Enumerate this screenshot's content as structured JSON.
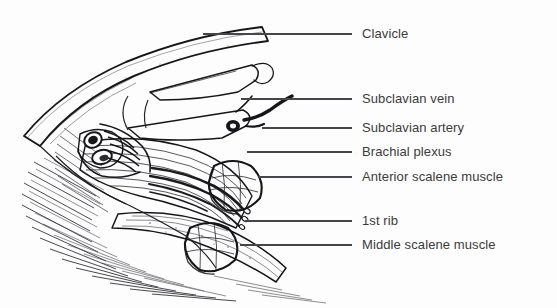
{
  "figure": {
    "kind": "anatomical-line-drawing",
    "view": "oblique anterior",
    "background_color": "#fdfdfd",
    "ink_color": "#16161a",
    "label_color": "#3b3b3b",
    "leader_color": "#45454a"
  },
  "labels": [
    {
      "id": "clavicle",
      "text": "Clavicle",
      "text_x": 362,
      "text_y": 35,
      "leader_x1": 203,
      "leader_x2": 352,
      "leader_y": 34
    },
    {
      "id": "subclavian-vein",
      "text": "Subclavian vein",
      "text_x": 362,
      "text_y": 100,
      "leader_x1": 241,
      "leader_x2": 352,
      "leader_y": 99
    },
    {
      "id": "subclavian-artery",
      "text": "Subclavian artery",
      "text_x": 362,
      "text_y": 129,
      "leader_x1": 262,
      "leader_x2": 352,
      "leader_y": 128
    },
    {
      "id": "brachial-plexus",
      "text": "Brachial plexus",
      "text_x": 362,
      "text_y": 153,
      "leader_x1": 247,
      "leader_x2": 352,
      "leader_y": 152
    },
    {
      "id": "anterior-scalene-muscle",
      "text": "Anterior scalene muscle",
      "text_x": 362,
      "text_y": 178,
      "leader_x1": 258,
      "leader_x2": 352,
      "leader_y": 177
    },
    {
      "id": "first-rib",
      "text": "1st rib",
      "text_x": 362,
      "text_y": 222,
      "leader_x1": 245,
      "leader_x2": 352,
      "leader_y": 221
    },
    {
      "id": "middle-scalene-muscle",
      "text": "Middle scalene muscle",
      "text_x": 362,
      "text_y": 246,
      "leader_x1": 240,
      "leader_x2": 352,
      "leader_y": 245
    }
  ],
  "structures": [
    {
      "id": "clavicle-body",
      "name": "clavicle",
      "rendering": "broad curved band, clean outline, sweeping lower-left to upper-right"
    },
    {
      "id": "subclavian-vein-body",
      "name": "subclavian vein",
      "rendering": "dark hooked vessel with stippled wedge, upper middle"
    },
    {
      "id": "subclavian-artery-body",
      "name": "subclavian artery",
      "rendering": "stippled tapering wedge beneath the vein"
    },
    {
      "id": "brachial-plexus-body",
      "name": "brachial plexus",
      "rendering": "bundled cords emerging between scalene muscles"
    },
    {
      "id": "anterior-scalene-body",
      "name": "anterior scalene muscle",
      "rendering": "cut muscle belly, cobblestone fascicle cross-section"
    },
    {
      "id": "middle-scalene-body",
      "name": "middle scalene muscle",
      "rendering": "lower cut muscle belly, cobblestone fascicle cross-section"
    },
    {
      "id": "first-rib-body",
      "name": "1st rib",
      "rendering": "pale curved bony arch running beneath the muscles"
    },
    {
      "id": "vessel-cluster",
      "name": "vessel cluster",
      "rendering": "dark tubular vessels with elliptical lumens, mid-left"
    },
    {
      "id": "hatching-field",
      "name": "shading hatchwork",
      "rendering": "dense parallel pen hatching fanning to lower right"
    }
  ]
}
